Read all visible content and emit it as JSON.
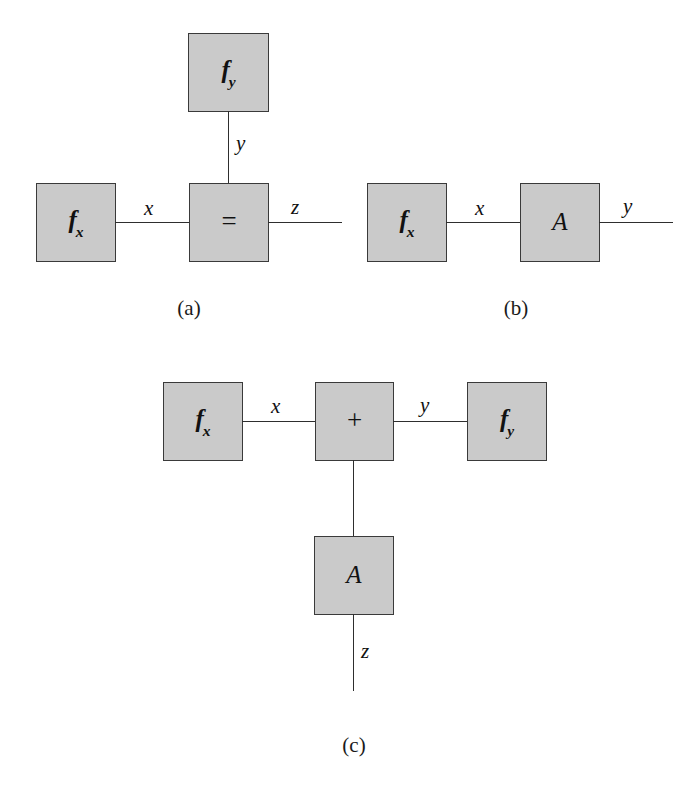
{
  "figure": {
    "type": "diagram",
    "colors": {
      "node_fill": "#cacaca",
      "node_border": "#3a3a3a",
      "edge": "#2e2e2e",
      "background": "#ffffff",
      "text": "#111111"
    }
  },
  "panels": [
    {
      "id": "a",
      "caption": "(a)",
      "nodes": [
        {
          "key": "fy",
          "base": "f",
          "sub": "y",
          "kind": "factor"
        },
        {
          "key": "fx",
          "base": "f",
          "sub": "x",
          "kind": "factor"
        },
        {
          "key": "equals",
          "base": "=",
          "sub": "",
          "kind": "operator"
        }
      ],
      "edges": [
        {
          "key": "y",
          "label": "y"
        },
        {
          "key": "x",
          "label": "x"
        },
        {
          "key": "z",
          "label": "z"
        }
      ]
    },
    {
      "id": "b",
      "caption": "(b)",
      "nodes": [
        {
          "key": "fx",
          "base": "f",
          "sub": "x",
          "kind": "factor"
        },
        {
          "key": "A",
          "base": "A",
          "sub": "",
          "kind": "matrix"
        }
      ],
      "edges": [
        {
          "key": "x",
          "label": "x"
        },
        {
          "key": "y",
          "label": "y"
        }
      ]
    },
    {
      "id": "c",
      "caption": "(c)",
      "nodes": [
        {
          "key": "fx",
          "base": "f",
          "sub": "x",
          "kind": "factor"
        },
        {
          "key": "plus",
          "base": "+",
          "sub": "",
          "kind": "operator"
        },
        {
          "key": "fy",
          "base": "f",
          "sub": "y",
          "kind": "factor"
        },
        {
          "key": "A",
          "base": "A",
          "sub": "",
          "kind": "matrix"
        }
      ],
      "edges": [
        {
          "key": "x",
          "label": "x"
        },
        {
          "key": "y",
          "label": "y"
        },
        {
          "key": "z",
          "label": "z"
        }
      ]
    }
  ]
}
